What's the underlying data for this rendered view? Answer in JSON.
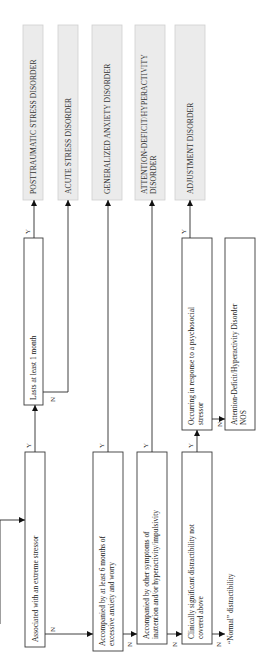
{
  "diagram": {
    "orientation": "rotated-90-counterclockwise",
    "decisions": {
      "extreme_stressor": "Associated with an extreme stressor",
      "lasts_one_month": "Lasts at least 1 month",
      "six_months_anxiety": [
        "Accompanied by at least 6 months of",
        "excessive anxiety and worry"
      ],
      "other_symptoms": [
        "Accompanied by other symptoms of",
        "inattention and/or hyperactivity/impulsivity"
      ],
      "clinically_significant": [
        "Clinically significant distractibility not",
        "covered above"
      ],
      "psychosocial_stressor": [
        "Occurring in response to a psychosocial",
        "stressor"
      ]
    },
    "outcomes": {
      "ptsd": [
        "POSTTRAUMATIC STRESS DISORDER"
      ],
      "asd": [
        "ACUTE STRESS DISORDER"
      ],
      "gad": [
        "GENERALIZED ANXIETY DISORDER"
      ],
      "adhd": [
        "ATTENTION-DEFICIT/HYPERACTIVITY",
        "DISORDER"
      ],
      "adjustment": [
        "ADJUSTMENT DISORDER"
      ],
      "adhd_nos": [
        "Attention-Deficit/Hyperactivity Disorder",
        "NOS"
      ],
      "normal": "“Normal” distractibility"
    },
    "labels": {
      "yes": "Y",
      "no": "N"
    }
  }
}
